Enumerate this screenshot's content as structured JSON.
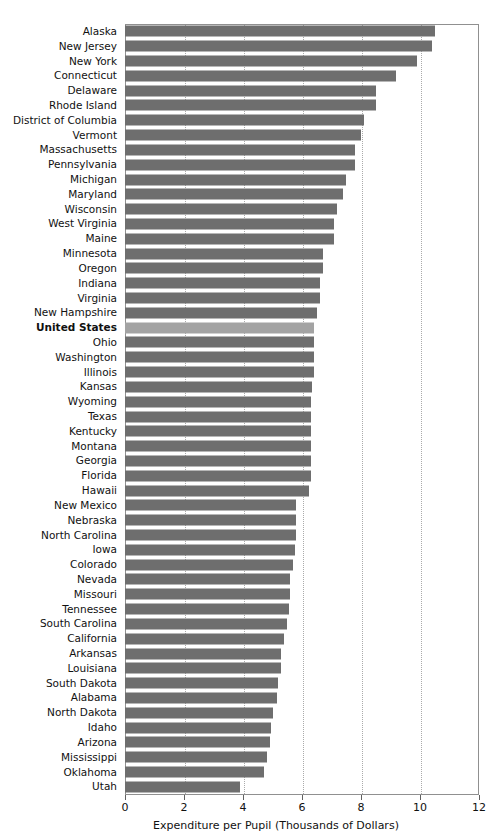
{
  "chart_data": {
    "type": "bar",
    "orientation": "horizontal",
    "title": "",
    "subtitle": "",
    "xlabel": "Expenditure per Pupil (Thousands of Dollars)",
    "ylabel": "",
    "xlim": [
      0,
      12
    ],
    "xticks": [
      0,
      2,
      4,
      6,
      8,
      10,
      12
    ],
    "xticklabels": [
      "0",
      "2",
      "4",
      "6",
      "8",
      "10",
      "12"
    ],
    "grid": "vertical-dotted",
    "legend": "none",
    "highlight_category": "United States",
    "colors": {
      "bar": "#6e6e6e",
      "bar_highlight": "#a3a3a3",
      "gridline": "#aaaaaa",
      "frame": "#909090",
      "text": "#111111"
    },
    "categories": [
      "Alaska",
      "New Jersey",
      "New York",
      "Connecticut",
      "Delaware",
      "Rhode Island",
      "District of Columbia",
      "Vermont",
      "Massachusetts",
      "Pennsylvania",
      "Michigan",
      "Maryland",
      "Wisconsin",
      "West Virginia",
      "Maine",
      "Minnesota",
      "Oregon",
      "Indiana",
      "Virginia",
      "New Hampshire",
      "United States",
      "Ohio",
      "Washington",
      "Illinois",
      "Kansas",
      "Wyoming",
      "Texas",
      "Kentucky",
      "Montana",
      "Georgia",
      "Florida",
      "Hawaii",
      "New Mexico",
      "Nebraska",
      "North Carolina",
      "Iowa",
      "Colorado",
      "Nevada",
      "Missouri",
      "Tennessee",
      "South Carolina",
      "California",
      "Arkansas",
      "Louisiana",
      "South Dakota",
      "Alabama",
      "North Dakota",
      "Idaho",
      "Arizona",
      "Mississippi",
      "Oklahoma",
      "Utah"
    ],
    "values": [
      10.5,
      10.4,
      9.9,
      9.2,
      8.5,
      8.5,
      8.1,
      8.0,
      7.8,
      7.8,
      7.5,
      7.4,
      7.2,
      7.1,
      7.1,
      6.7,
      6.7,
      6.6,
      6.6,
      6.5,
      6.4,
      6.4,
      6.4,
      6.4,
      6.35,
      6.3,
      6.3,
      6.3,
      6.3,
      6.3,
      6.3,
      6.25,
      5.8,
      5.8,
      5.8,
      5.75,
      5.7,
      5.6,
      5.6,
      5.55,
      5.5,
      5.4,
      5.3,
      5.3,
      5.2,
      5.15,
      5.0,
      4.95,
      4.9,
      4.8,
      4.7,
      3.9
    ]
  }
}
